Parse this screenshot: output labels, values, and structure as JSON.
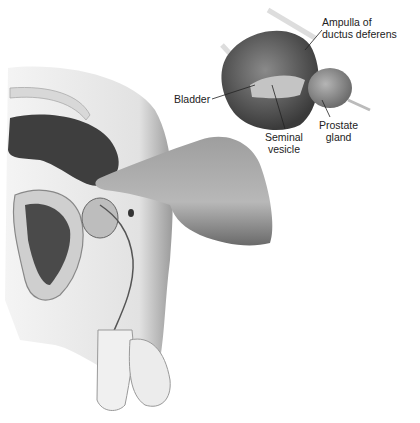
{
  "figure": {
    "labels": {
      "ampulla": [
        "Ampulla of",
        "ductus deferens"
      ],
      "bladder": "Bladder",
      "seminal": [
        "Seminal",
        "vesicle"
      ],
      "prostate": [
        "Prostate",
        "gland"
      ]
    }
  }
}
